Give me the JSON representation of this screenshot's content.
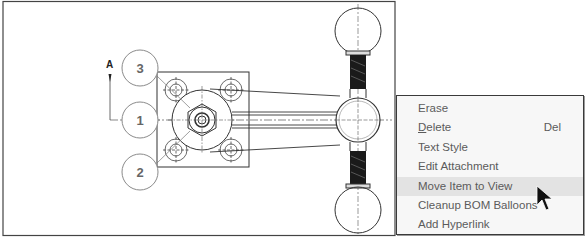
{
  "drawing": {
    "section_label": "A",
    "balloons": [
      {
        "id": "balloon-3",
        "label": "3"
      },
      {
        "id": "balloon-1",
        "label": "1"
      },
      {
        "id": "balloon-2",
        "label": "2"
      }
    ],
    "colors": {
      "line": "#2a2a2a",
      "balloon": "#8a8a8a",
      "centerline": "#555555"
    }
  },
  "context_menu": {
    "items": [
      {
        "label": "Erase",
        "shortcut": ""
      },
      {
        "label_underlined": "D",
        "label_rest": "elete",
        "label": "Delete",
        "shortcut": "Del"
      },
      {
        "label": "Text Style",
        "shortcut": ""
      },
      {
        "label": "Edit Attachment",
        "shortcut": ""
      },
      {
        "label": "Move Item to View",
        "shortcut": "",
        "highlighted": true
      },
      {
        "label": "Cleanup BOM Balloons",
        "shortcut": ""
      },
      {
        "label": "Add Hyperlink",
        "shortcut": ""
      }
    ],
    "colors": {
      "background": "#f7f7f7",
      "highlight": "#e3e3e3",
      "text": "#5b5b5b",
      "border": "#3a3a3a"
    }
  }
}
